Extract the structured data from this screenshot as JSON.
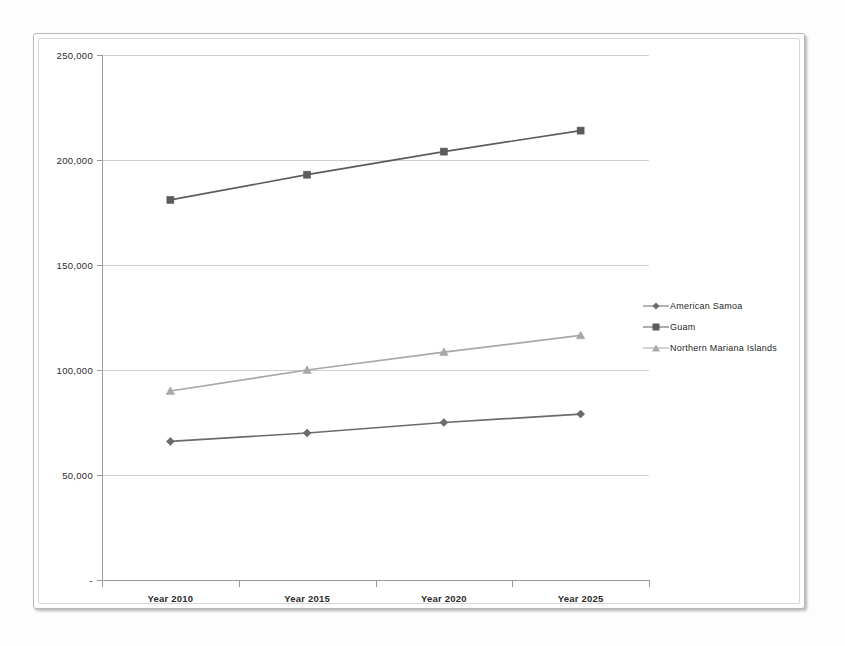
{
  "chart_data": {
    "type": "line",
    "title": "",
    "xlabel": "",
    "ylabel": "",
    "categories": [
      "Year 2010",
      "Year 2015",
      "Year 2020",
      "Year 2025"
    ],
    "ylim": [
      0,
      250000
    ],
    "ytick_labels": [
      "250,000",
      "200,000",
      "150,000",
      "100,000",
      "50,000",
      "-"
    ],
    "ytick_values": [
      250000,
      200000,
      150000,
      100000,
      50000,
      0
    ],
    "grid": true,
    "legend_position": "right",
    "series": [
      {
        "name": "American Samoa",
        "marker": "diamond",
        "color": "#6b6b6b",
        "values": [
          66000,
          70000,
          75000,
          79000
        ]
      },
      {
        "name": "Guam",
        "marker": "square",
        "color": "#5c5c5c",
        "values": [
          181000,
          193000,
          204000,
          214000
        ]
      },
      {
        "name": "Northern Mariana Islands",
        "marker": "triangle",
        "color": "#a8a8a8",
        "values": [
          90000,
          100000,
          108500,
          116500
        ]
      }
    ]
  },
  "colors": {
    "american_samoa": "#6b6b6b",
    "guam": "#5c5c5c",
    "northern_mariana_islands": "#a8a8a8",
    "gridline": "#d0d0d0",
    "axis": "#9a9a9a",
    "frame_border": "#b9b9b9",
    "page_background": "#fdfdfd"
  }
}
